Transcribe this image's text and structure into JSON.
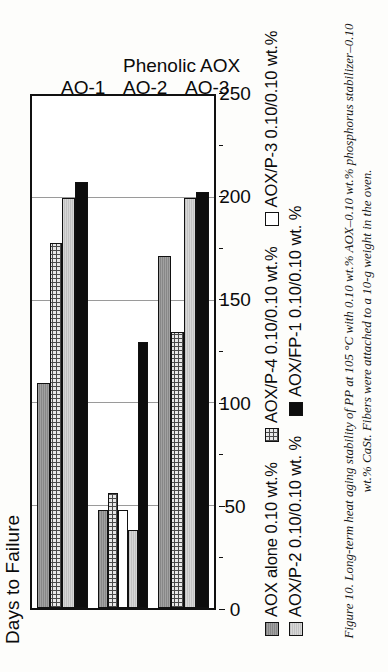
{
  "figure": {
    "caption": "Figure 10. Long-term heat aging stability of PP at 105 °C with 0.10 wt.% AOX–0.10 wt.% phosphorus stabilizer–0.10 wt.% CaSt. Fibers were attached to a 10-g weight in the oven."
  },
  "legend": {
    "items": [
      {
        "label": "AOX alone 0.10 wt.%",
        "fill": "darkgray"
      },
      {
        "label": "AOX/P-4 0.10/0.10 wt.%",
        "fill": "hatch"
      },
      {
        "label": "AOX/P-3 0.10/0.10 wt.%",
        "fill": "white"
      },
      {
        "label": "AOX/P-2 0.10/0.10 wt. %",
        "fill": "lightgray"
      },
      {
        "label": "AOX/FP-1 0.10/0.10 wt. %",
        "fill": "black"
      }
    ]
  },
  "chart_data": {
    "type": "bar",
    "orientation": "horizontal",
    "title": "",
    "ylabel": "Days to Failure",
    "xlabel": "Phenolic AOX",
    "categories": [
      "AO-1",
      "AO-2",
      "AO-3"
    ],
    "value_axis_label": "Days to Failure",
    "ticks": [
      0,
      50,
      100,
      150,
      200,
      250
    ],
    "tick_labels": [
      "0",
      "50",
      "100",
      "150",
      "200",
      "250"
    ],
    "minor_ticks": [
      25,
      75,
      125,
      175,
      225
    ],
    "xlim": [
      0,
      250
    ],
    "grid": true,
    "grid_axis": "value",
    "legend_position": "below",
    "series": [
      {
        "name": "AOX alone 0.10 wt.%",
        "fill": "darkgray",
        "values": [
          110,
          48,
          172
        ]
      },
      {
        "name": "AOX/P-4 0.10/0.10 wt.%",
        "fill": "hatch",
        "values": [
          178,
          56,
          135
        ]
      },
      {
        "name": "AOX/P-3 0.10/0.10 wt.%",
        "fill": "white",
        "values": [
          null,
          48,
          null
        ]
      },
      {
        "name": "AOX/P-2 0.10/0.10 wt. %",
        "fill": "lightgray",
        "values": [
          200,
          38,
          200
        ]
      },
      {
        "name": "AOX/FP-1 0.10/0.10 wt. %",
        "fill": "black",
        "values": [
          208,
          130,
          203
        ]
      }
    ]
  }
}
